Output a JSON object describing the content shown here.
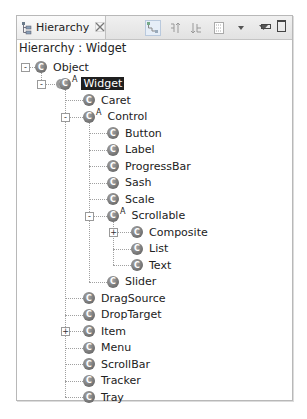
{
  "view": {
    "tab_label": "Hierarchy",
    "tab_icon": "hierarchy-icon",
    "close_icon": "close-icon",
    "title": "Hierarchy : Widget"
  },
  "toolbar": {
    "buttons": [
      {
        "name": "show-type-hierarchy",
        "icon": "type-hierarchy-icon",
        "active": true
      },
      {
        "name": "show-supertype-hierarchy",
        "icon": "supertype-hierarchy-icon",
        "active": false
      },
      {
        "name": "show-subtype-hierarchy",
        "icon": "subtype-hierarchy-icon",
        "active": false
      },
      {
        "name": "history",
        "icon": "history-list-icon",
        "active": false
      },
      {
        "name": "history-dropdown",
        "icon": "small-dropdown-icon",
        "active": false
      },
      {
        "name": "view-menu",
        "icon": "view-menu-icon",
        "active": false
      }
    ],
    "minimize": "minimize-icon",
    "maximize": "maximize-icon"
  },
  "tree": {
    "class_icon_glyph": "C",
    "abstract_marker": "A",
    "nodes": [
      {
        "label": "Object",
        "depth": 0,
        "toggle": "-",
        "abstract": false,
        "selected": false
      },
      {
        "label": "Widget",
        "depth": 1,
        "toggle": "-",
        "abstract": true,
        "selected": true
      },
      {
        "label": "Caret",
        "depth": 2,
        "toggle": "",
        "abstract": false,
        "selected": false
      },
      {
        "label": "Control",
        "depth": 2,
        "toggle": "-",
        "abstract": true,
        "selected": false
      },
      {
        "label": "Button",
        "depth": 3,
        "toggle": "",
        "abstract": false,
        "selected": false
      },
      {
        "label": "Label",
        "depth": 3,
        "toggle": "",
        "abstract": false,
        "selected": false
      },
      {
        "label": "ProgressBar",
        "depth": 3,
        "toggle": "",
        "abstract": false,
        "selected": false
      },
      {
        "label": "Sash",
        "depth": 3,
        "toggle": "",
        "abstract": false,
        "selected": false
      },
      {
        "label": "Scale",
        "depth": 3,
        "toggle": "",
        "abstract": false,
        "selected": false
      },
      {
        "label": "Scrollable",
        "depth": 3,
        "toggle": "-",
        "abstract": true,
        "selected": false
      },
      {
        "label": "Composite",
        "depth": 4,
        "toggle": "+",
        "abstract": false,
        "selected": false
      },
      {
        "label": "List",
        "depth": 4,
        "toggle": "",
        "abstract": false,
        "selected": false
      },
      {
        "label": "Text",
        "depth": 4,
        "toggle": "",
        "abstract": false,
        "selected": false
      },
      {
        "label": "Slider",
        "depth": 3,
        "toggle": "",
        "abstract": false,
        "selected": false
      },
      {
        "label": "DragSource",
        "depth": 2,
        "toggle": "",
        "abstract": false,
        "selected": false
      },
      {
        "label": "DropTarget",
        "depth": 2,
        "toggle": "",
        "abstract": false,
        "selected": false
      },
      {
        "label": "Item",
        "depth": 2,
        "toggle": "+",
        "abstract": false,
        "selected": false
      },
      {
        "label": "Menu",
        "depth": 2,
        "toggle": "",
        "abstract": false,
        "selected": false
      },
      {
        "label": "ScrollBar",
        "depth": 2,
        "toggle": "",
        "abstract": false,
        "selected": false
      },
      {
        "label": "Tracker",
        "depth": 2,
        "toggle": "",
        "abstract": false,
        "selected": false
      },
      {
        "label": "Tray",
        "depth": 2,
        "toggle": "",
        "abstract": false,
        "selected": false
      }
    ]
  },
  "colors": {
    "selection_bg": "#1f1f1f",
    "selection_fg": "#ffffff",
    "class_icon": "#7a7a7a",
    "panel_border": "#b8b8b8"
  }
}
